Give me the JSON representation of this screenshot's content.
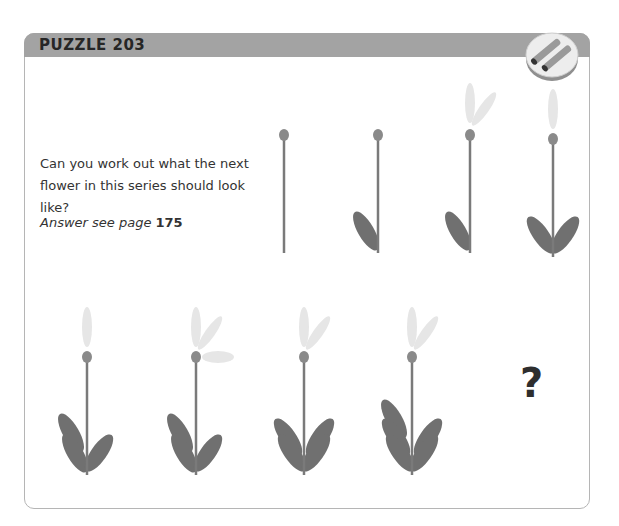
{
  "puzzle": {
    "title": "PUZZLE 203",
    "question": "Can you work out what the next flower in this series should look like?",
    "answer_prefix": "Answer see page ",
    "answer_page": "175",
    "unknown_symbol": "?"
  },
  "badge": {
    "icon": "pencils-icon"
  },
  "colors": {
    "header": "#a3a3a3",
    "stem": "#7a7a7a",
    "leaf": "#707070",
    "bud": "#8a8a8a",
    "petal": "#e6e6e6",
    "border": "#b5b5b5"
  },
  "series": [
    {
      "index": 1,
      "petals": 0,
      "leaves_left": 0,
      "leaves_right": 0
    },
    {
      "index": 2,
      "petals": 0,
      "leaves_left": 1,
      "leaves_right": 0
    },
    {
      "index": 3,
      "petals": 2,
      "leaves_left": 1,
      "leaves_right": 0
    },
    {
      "index": 4,
      "petals": 1,
      "leaves_left": 1,
      "leaves_right": 1
    },
    {
      "index": 5,
      "petals": 1,
      "leaves_left": 2,
      "leaves_right": 1
    },
    {
      "index": 6,
      "petals": 3,
      "leaves_left": 2,
      "leaves_right": 1
    },
    {
      "index": 7,
      "petals": 2,
      "leaves_left": 2,
      "leaves_right": 2
    },
    {
      "index": 8,
      "petals": 2,
      "leaves_left": 3,
      "leaves_right": 2
    },
    {
      "index": 9,
      "unknown": true
    }
  ]
}
